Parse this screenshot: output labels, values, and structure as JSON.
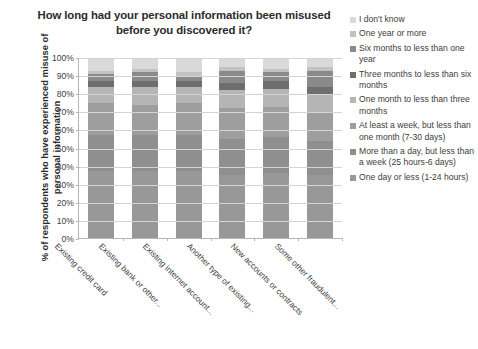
{
  "chart_data": {
    "type": "bar",
    "subtype": "stacked-100-percent-column",
    "title": "How long had your personal information been misused before you discovered it?",
    "xlabel": "",
    "ylabel": "% of respondents who have experienced misuse of personal information",
    "ylim": [
      0,
      100
    ],
    "ytick_labels": [
      "100%",
      "90%",
      "80%",
      "70%",
      "60%",
      "50%",
      "40%",
      "30%",
      "20%",
      "10%",
      "0%"
    ],
    "ytick_values": [
      100,
      90,
      80,
      70,
      60,
      50,
      40,
      30,
      20,
      10,
      0
    ],
    "grid": true,
    "legend_position": "right",
    "categories": [
      "Existing credit card",
      "Existing bank or other...",
      "Existing internet account...",
      "Another type of existing...",
      "New accounts or contracts",
      "Some other fraudulent..."
    ],
    "series": [
      {
        "name": "I don't know",
        "color": "#d9d9d9",
        "values": [
          7,
          6,
          8,
          5,
          6,
          5
        ]
      },
      {
        "name": "One year or more",
        "color": "#c2c2c2",
        "values": [
          2,
          2,
          2,
          2,
          2,
          2
        ]
      },
      {
        "name": "Six months to less than one year",
        "color": "#8a8a8a",
        "values": [
          4,
          5,
          3,
          7,
          5,
          9
        ]
      },
      {
        "name": "Three months to less than six months",
        "color": "#6e6e6e",
        "values": [
          3,
          3,
          3,
          4,
          4,
          4
        ]
      },
      {
        "name": "One month to less than three months",
        "color": "#b5b5b5",
        "values": [
          9,
          10,
          9,
          10,
          10,
          10
        ]
      },
      {
        "name": "At least a week, but less than one month (7-30 days)",
        "color": "#9e9e9e",
        "values": [
          18,
          17,
          18,
          17,
          17,
          16
        ]
      },
      {
        "name": "More than a day, but less than a week (25 hours-6 days)",
        "color": "#8f8f8f",
        "values": [
          20,
          20,
          20,
          20,
          20,
          19
        ]
      },
      {
        "name": "One day or less (1-24 hours)",
        "color": "#989898",
        "values": [
          37,
          37,
          37,
          35,
          36,
          35
        ]
      }
    ]
  }
}
